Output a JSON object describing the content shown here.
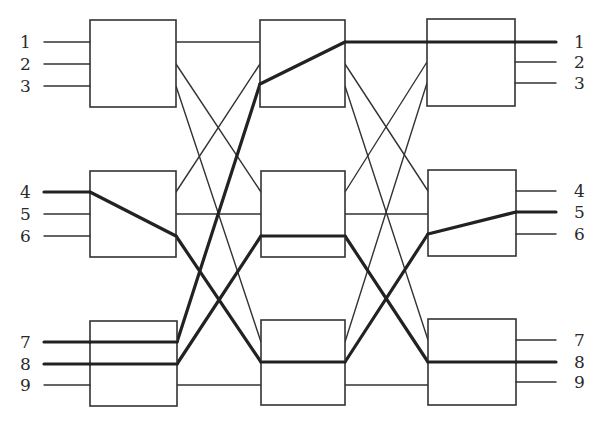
{
  "diagram": {
    "colors": {
      "line": "#333333",
      "background": "#ffffff"
    },
    "input_labels": [
      "1",
      "2",
      "3",
      "4",
      "5",
      "6",
      "7",
      "8",
      "9"
    ],
    "output_labels": [
      "1",
      "2",
      "3",
      "4",
      "5",
      "6",
      "7",
      "8",
      "9"
    ],
    "stages": [
      {
        "name": "ingress",
        "boxes": [
          {
            "id": "L1",
            "x": 90,
            "y": 20,
            "w": 86,
            "h": 87,
            "ports": [
              42,
              64,
              86
            ]
          },
          {
            "id": "L2",
            "x": 90,
            "y": 171,
            "w": 86,
            "h": 86,
            "ports": [
              192,
              214,
              236
            ]
          },
          {
            "id": "L3",
            "x": 90,
            "y": 321,
            "w": 87,
            "h": 85,
            "ports": [
              342,
              364,
              385
            ]
          }
        ]
      },
      {
        "name": "middle",
        "boxes": [
          {
            "id": "M1",
            "x": 260,
            "y": 20,
            "w": 85,
            "h": 87,
            "ports": [
              42,
              64,
              86
            ]
          },
          {
            "id": "M2",
            "x": 261,
            "y": 171,
            "w": 84,
            "h": 86,
            "ports": [
              192,
              214,
              236
            ]
          },
          {
            "id": "M3",
            "x": 261,
            "y": 320,
            "w": 84,
            "h": 85,
            "ports": [
              342,
              362,
              385
            ]
          }
        ]
      },
      {
        "name": "egress",
        "boxes": [
          {
            "id": "R1",
            "x": 427,
            "y": 19,
            "w": 88,
            "h": 87,
            "ports": [
              42,
              62,
              83
            ]
          },
          {
            "id": "R2",
            "x": 428,
            "y": 170,
            "w": 88,
            "h": 86,
            "ports": [
              191,
              212,
              234
            ]
          },
          {
            "id": "R3",
            "x": 428,
            "y": 319,
            "w": 88,
            "h": 86,
            "ports": [
              340,
              362,
              382
            ]
          }
        ]
      }
    ],
    "input_lines": [
      {
        "label": "1",
        "y": 42,
        "x1": 44,
        "x2": 90,
        "active": false
      },
      {
        "label": "2",
        "y": 64,
        "x1": 44,
        "x2": 90,
        "active": false
      },
      {
        "label": "3",
        "y": 86,
        "x1": 44,
        "x2": 90,
        "active": false
      },
      {
        "label": "4",
        "y": 192,
        "x1": 44,
        "x2": 90,
        "active": true
      },
      {
        "label": "5",
        "y": 214,
        "x1": 44,
        "x2": 90,
        "active": false
      },
      {
        "label": "6",
        "y": 236,
        "x1": 44,
        "x2": 90,
        "active": false
      },
      {
        "label": "7",
        "y": 342,
        "x1": 44,
        "x2": 90,
        "active": true
      },
      {
        "label": "8",
        "y": 364,
        "x1": 44,
        "x2": 90,
        "active": true
      },
      {
        "label": "9",
        "y": 385,
        "x1": 44,
        "x2": 90,
        "active": false
      }
    ],
    "output_lines": [
      {
        "label": "1",
        "y": 42,
        "x1": 515,
        "x2": 556,
        "active": true
      },
      {
        "label": "2",
        "y": 62,
        "x1": 515,
        "x2": 556,
        "active": false
      },
      {
        "label": "3",
        "y": 83,
        "x1": 515,
        "x2": 556,
        "active": false
      },
      {
        "label": "4",
        "y": 191,
        "x1": 516,
        "x2": 556,
        "active": false
      },
      {
        "label": "5",
        "y": 212,
        "x1": 516,
        "x2": 556,
        "active": true
      },
      {
        "label": "6",
        "y": 234,
        "x1": 516,
        "x2": 556,
        "active": false
      },
      {
        "label": "7",
        "y": 340,
        "x1": 516,
        "x2": 556,
        "active": false
      },
      {
        "label": "8",
        "y": 362,
        "x1": 516,
        "x2": 556,
        "active": true
      },
      {
        "label": "9",
        "y": 382,
        "x1": 516,
        "x2": 556,
        "active": false
      }
    ],
    "interstage_links": [
      {
        "from": "L1.1",
        "to": "M1.1",
        "x1": 176,
        "y1": 42,
        "x2": 260,
        "y2": 42,
        "active": false
      },
      {
        "from": "L1.2",
        "to": "M2.1",
        "x1": 176,
        "y1": 64,
        "x2": 261,
        "y2": 192,
        "active": false
      },
      {
        "from": "L1.3",
        "to": "M3.1",
        "x1": 176,
        "y1": 86,
        "x2": 261,
        "y2": 342,
        "active": false
      },
      {
        "from": "L2.1",
        "to": "M1.2",
        "x1": 176,
        "y1": 192,
        "x2": 260,
        "y2": 64,
        "active": false
      },
      {
        "from": "L2.2",
        "to": "M2.2",
        "x1": 176,
        "y1": 214,
        "x2": 261,
        "y2": 214,
        "active": false
      },
      {
        "from": "L2.3",
        "to": "M3.2",
        "x1": 176,
        "y1": 236,
        "x2": 261,
        "y2": 362,
        "active": true
      },
      {
        "from": "L3.1",
        "to": "M1.3",
        "x1": 177,
        "y1": 342,
        "x2": 260,
        "y2": 84,
        "active": true
      },
      {
        "from": "L3.2",
        "to": "M2.3",
        "x1": 177,
        "y1": 364,
        "x2": 261,
        "y2": 236,
        "active": true
      },
      {
        "from": "L3.3",
        "to": "M3.3",
        "x1": 177,
        "y1": 385,
        "x2": 261,
        "y2": 385,
        "active": false
      },
      {
        "from": "M1.1",
        "to": "R1.1",
        "x1": 345,
        "y1": 42,
        "x2": 427,
        "y2": 42,
        "active": true
      },
      {
        "from": "M1.2",
        "to": "R2.1",
        "x1": 345,
        "y1": 64,
        "x2": 428,
        "y2": 191,
        "active": false
      },
      {
        "from": "M1.3",
        "to": "R3.1",
        "x1": 345,
        "y1": 86,
        "x2": 428,
        "y2": 340,
        "active": false
      },
      {
        "from": "M2.1",
        "to": "R1.2",
        "x1": 345,
        "y1": 192,
        "x2": 427,
        "y2": 62,
        "active": false
      },
      {
        "from": "M2.2",
        "to": "R2.2",
        "x1": 345,
        "y1": 214,
        "x2": 428,
        "y2": 214,
        "active": false
      },
      {
        "from": "M2.3",
        "to": "R3.2",
        "x1": 345,
        "y1": 236,
        "x2": 428,
        "y2": 362,
        "active": true
      },
      {
        "from": "M3.1",
        "to": "R1.3",
        "x1": 345,
        "y1": 342,
        "x2": 427,
        "y2": 83,
        "active": false
      },
      {
        "from": "M3.2",
        "to": "R2.3",
        "x1": 345,
        "y1": 362,
        "x2": 428,
        "y2": 234,
        "active": true
      },
      {
        "from": "M3.3",
        "to": "R3.3",
        "x1": 345,
        "y1": 385,
        "x2": 428,
        "y2": 385,
        "active": false
      }
    ],
    "internal_paths": [
      {
        "box": "L2",
        "desc": "in1 to out3",
        "x1": 90,
        "y1": 192,
        "x2": 176,
        "y2": 236
      },
      {
        "box": "L3",
        "desc": "in1 to out1",
        "x1": 90,
        "y1": 342,
        "x2": 177,
        "y2": 342
      },
      {
        "box": "L3",
        "desc": "in2 to out2",
        "x1": 90,
        "y1": 364,
        "x2": 177,
        "y2": 364
      },
      {
        "box": "M1",
        "desc": "in3 to out1",
        "x1": 260,
        "y1": 84,
        "x2": 345,
        "y2": 42
      },
      {
        "box": "M2",
        "desc": "in3 to out3",
        "x1": 261,
        "y1": 236,
        "x2": 345,
        "y2": 236
      },
      {
        "box": "M3",
        "desc": "in2 to out2",
        "x1": 261,
        "y1": 362,
        "x2": 345,
        "y2": 362
      },
      {
        "box": "R1",
        "desc": "in1 to out1",
        "x1": 427,
        "y1": 42,
        "x2": 515,
        "y2": 42
      },
      {
        "box": "R2",
        "desc": "in3 to out2",
        "x1": 428,
        "y1": 234,
        "x2": 516,
        "y2": 212
      },
      {
        "box": "R3",
        "desc": "in2 to out2",
        "x1": 428,
        "y1": 362,
        "x2": 516,
        "y2": 362
      }
    ],
    "connections": [
      {
        "input": "4",
        "output": "5",
        "route": [
          "L2",
          "M3",
          "R2"
        ]
      },
      {
        "input": "7",
        "output": "1",
        "route": [
          "L3",
          "M1",
          "R1"
        ]
      },
      {
        "input": "8",
        "output": "8",
        "route": [
          "L3",
          "M2",
          "R3"
        ]
      }
    ],
    "label_positions": {
      "input_x": 20,
      "output_x": 574
    }
  }
}
